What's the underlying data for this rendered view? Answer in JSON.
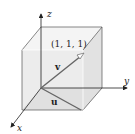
{
  "diagram": {
    "axes": {
      "x": "x",
      "y": "y",
      "z": "z"
    },
    "point_label": "(1, 1, 1)",
    "vectors": {
      "v": "v",
      "u": "u"
    },
    "colors": {
      "cube_fill": "#e6e6e6",
      "cube_top": "#f2f2f2",
      "edge": "#555555",
      "vector": "#666666",
      "axis": "#222222"
    }
  }
}
